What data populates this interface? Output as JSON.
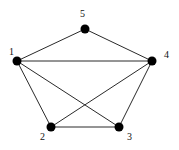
{
  "graph": {
    "nodes": [
      {
        "id": "1",
        "label": "1",
        "x": 17,
        "y": 61,
        "lx": 9,
        "ly": 55
      },
      {
        "id": "2",
        "label": "2",
        "x": 51,
        "y": 127,
        "lx": 40,
        "ly": 140
      },
      {
        "id": "3",
        "label": "3",
        "x": 119,
        "y": 127,
        "lx": 127,
        "ly": 140
      },
      {
        "id": "4",
        "label": "4",
        "x": 152,
        "y": 61,
        "lx": 164,
        "ly": 58
      },
      {
        "id": "5",
        "label": "5",
        "x": 85,
        "y": 29,
        "lx": 80,
        "ly": 17
      }
    ],
    "edges": [
      [
        "1",
        "5"
      ],
      [
        "5",
        "4"
      ],
      [
        "1",
        "4"
      ],
      [
        "1",
        "2"
      ],
      [
        "1",
        "3"
      ],
      [
        "4",
        "2"
      ],
      [
        "4",
        "3"
      ],
      [
        "2",
        "3"
      ]
    ],
    "node_color": "#000000",
    "edge_color": "#2a2a2a"
  }
}
